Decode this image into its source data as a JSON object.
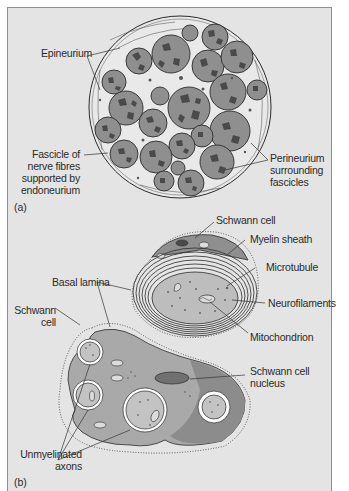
{
  "figure": {
    "panel_a": {
      "letter": "(a)",
      "subject": "nerve cross-section",
      "labels": {
        "epineurium": "Epineurium",
        "fascicle": "Fascicle of\nnerve fibres\nsupported by\nendoneurium",
        "perineurium": "Perineurium\nsurrounding\nfascicles"
      }
    },
    "panel_b": {
      "letter": "(b)",
      "subject": "myelinated and unmyelinated axons",
      "labels": {
        "schwann_cell_top": "Schwann cell",
        "myelin_sheath": "Myelin sheath",
        "microtubule": "Microtubule",
        "neurofilaments": "Neurofilaments",
        "mitochondrion": "Mitochondrion",
        "basal_lamina": "Basal lamina",
        "schwann_cell_left": "Schwann\ncell",
        "schwann_nucleus": "Schwann cell\nnucleus",
        "unmyelinated_axons": "Unmyelinated\naxons"
      }
    },
    "colors": {
      "background": "#e4e4e4",
      "frame_border": "#8e8e8e",
      "fascicle_fill": "#8f8f8f",
      "fascicle_dark": "#4a4a4a",
      "cytoplasm": "#a9a9a9",
      "cytoplasm_dark": "#8c8c8c",
      "nucleus": "#707070",
      "axon": "#c3c3c3",
      "ink": "#2b2b2b"
    }
  }
}
